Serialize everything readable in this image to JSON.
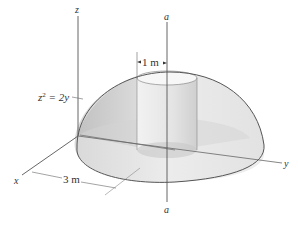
{
  "figure": {
    "axes": {
      "x_label": "x",
      "y_label": "y",
      "z_label": "z"
    },
    "axis_of_rotation": {
      "top_label": "a",
      "bottom_label": "a"
    },
    "equation_label": "z² = 2y",
    "equation_parts": {
      "base": "z",
      "exp": "2",
      "rest": " = 2y"
    },
    "dimensions": {
      "cylinder_radius": "1 m",
      "dome_radius": "3 m"
    },
    "colors": {
      "line": "#555555",
      "dome_fill": "#e6e6e6",
      "cut_face": "#cfcfcf",
      "cylinder": "#dedede",
      "base": "#ebebeb"
    }
  }
}
